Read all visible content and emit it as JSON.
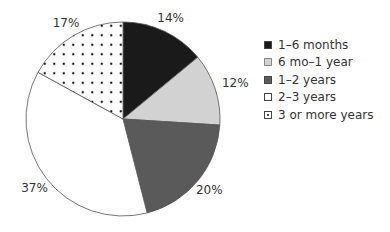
{
  "chart_data": {
    "type": "pie",
    "title": "",
    "categories": [
      "1–6 months",
      "6 mo–1 year",
      "1–2 years",
      "2–3 years",
      "3 or more years"
    ],
    "values": [
      14,
      12,
      20,
      37,
      17
    ],
    "labels": [
      "14%",
      "12%",
      "20%",
      "37%",
      "17%"
    ],
    "colors": [
      "#1a1a1a",
      "#d2d2d2",
      "#5a5a5a",
      "#ffffff",
      "dotted"
    ],
    "legend_position": "right",
    "start_angle": "12 o'clock, clockwise"
  },
  "legend": {
    "items": [
      {
        "label": "1–6 months",
        "color": "#1a1a1a"
      },
      {
        "label": "6 mo–1 year",
        "color": "#d2d2d2"
      },
      {
        "label": "1–2 years",
        "color": "#5a5a5a"
      },
      {
        "label": "2–3 years",
        "color": "#ffffff"
      },
      {
        "label": "3 or more years",
        "color": "dotted"
      }
    ]
  }
}
